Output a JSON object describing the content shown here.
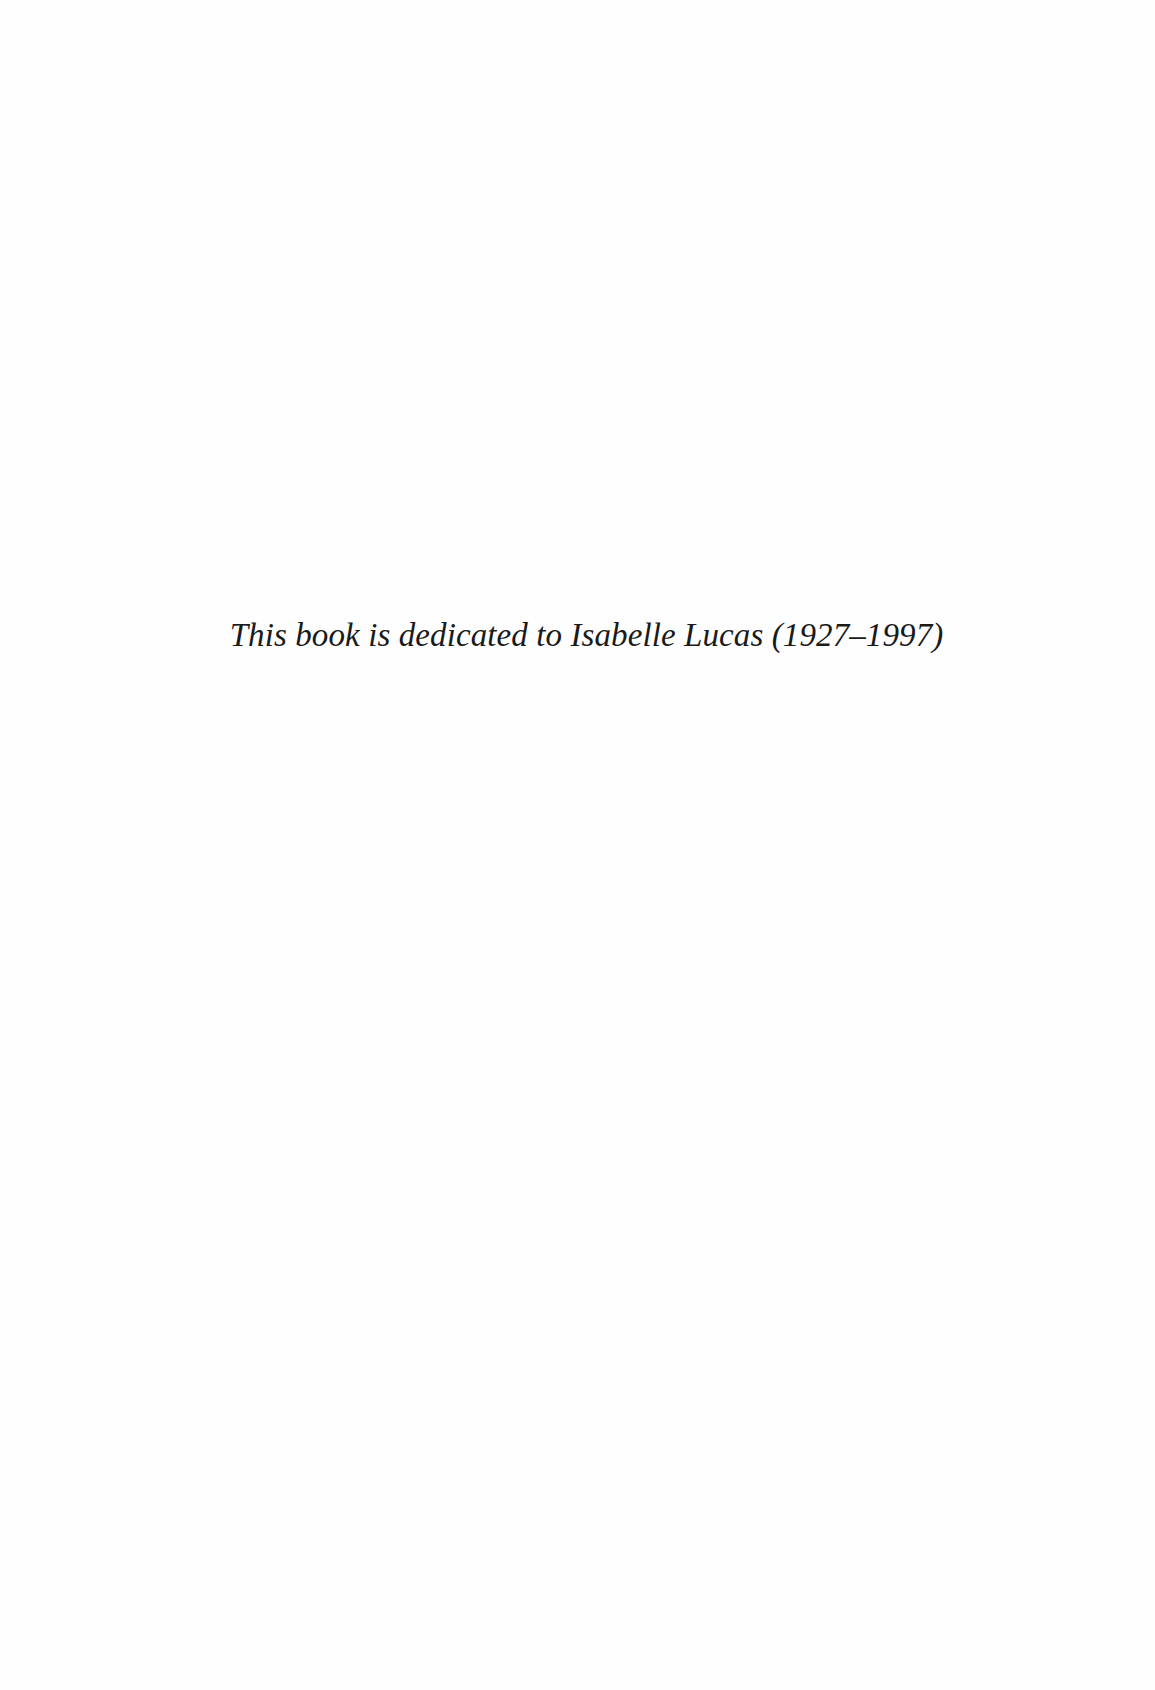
{
  "page": {
    "dedication": "This book is dedicated to Isabelle Lucas (1927–1997)"
  }
}
